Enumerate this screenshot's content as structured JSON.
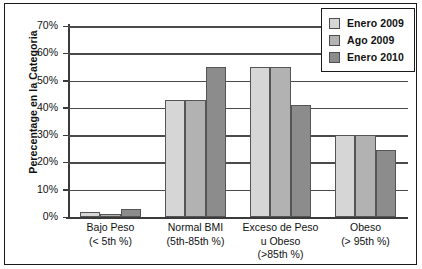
{
  "chart_data": {
    "type": "bar",
    "title": "",
    "xlabel": "",
    "ylabel": "Perecentage en la Categoria",
    "ylim": [
      0,
      70
    ],
    "ytick_labels": [
      "70%",
      "60%",
      "50%",
      "40%",
      "30%",
      "20%",
      "10%",
      "0%"
    ],
    "ytick_values": [
      70,
      60,
      50,
      40,
      30,
      20,
      10,
      0
    ],
    "grid": true,
    "legend_position": "top-right",
    "categories": [
      "Bajo Peso\n(< 5th %)",
      "Normal BMI\n(5th-85th %)",
      "Exceso de Peso\nu Obeso\n(>85th %)",
      "Obeso\n(> 95th %)"
    ],
    "category_lines": [
      [
        "Bajo Peso",
        "(< 5th %)"
      ],
      [
        "Normal BMI",
        "(5th-85th %)"
      ],
      [
        "Exceso de Peso",
        "u Obeso",
        "(>85th %)"
      ],
      [
        "Obeso",
        "(> 95th %)"
      ]
    ],
    "series": [
      {
        "name": "Enero 2009",
        "color": "#d6d6d6",
        "values": [
          1.7,
          43,
          55,
          30
        ]
      },
      {
        "name": "Ago 2009",
        "color": "#b2b2b2",
        "values": [
          1,
          43,
          55,
          30
        ]
      },
      {
        "name": "Enero 2010",
        "color": "#8c8c8c",
        "values": [
          3,
          55,
          41,
          24.7
        ]
      }
    ]
  },
  "legend": {
    "items": [
      {
        "label": "Enero 2009",
        "color": "#d6d6d6"
      },
      {
        "label": "Ago 2009",
        "color": "#b2b2b2"
      },
      {
        "label": "Enero 2010",
        "color": "#8c8c8c"
      }
    ]
  }
}
